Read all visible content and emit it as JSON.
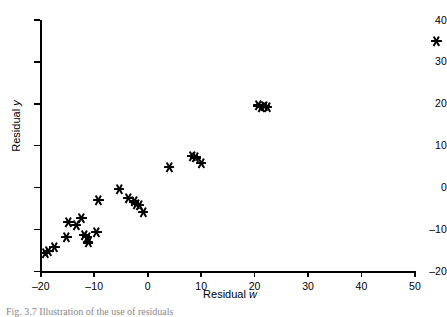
{
  "chart_data": {
    "type": "scatter",
    "title": "",
    "xlabel": "Residual w",
    "ylabel": "Residual y",
    "xlim": [
      -20,
      50
    ],
    "ylim": [
      -20,
      40
    ],
    "xticks": [
      -20,
      -10,
      0,
      10,
      20,
      30,
      40,
      50
    ],
    "yticks": [
      -20,
      -10,
      0,
      10,
      20,
      30,
      40
    ],
    "xticklabels": [
      "-20",
      "-10",
      "0",
      "10",
      "20",
      "30",
      "40",
      "50"
    ],
    "yticklabels": [
      "-20",
      "-10",
      "0",
      "10",
      "20",
      "30",
      "40"
    ],
    "grid": false,
    "legend": null,
    "marker": "asterisk",
    "marker_color": "#000000",
    "series": [
      {
        "name": "residuals",
        "points": [
          [
            -19.2,
            -15.6
          ],
          [
            -18.6,
            -15.2
          ],
          [
            -17.4,
            -14.1
          ],
          [
            -15.2,
            -11.7
          ],
          [
            -14.8,
            -8.3
          ],
          [
            -13.4,
            -9.0
          ],
          [
            -12.4,
            -7.2
          ],
          [
            -11.8,
            -11.4
          ],
          [
            -11.4,
            -11.8
          ],
          [
            -11.2,
            -13.1
          ],
          [
            -9.6,
            -10.5
          ],
          [
            -9.2,
            -2.9
          ],
          [
            -5.4,
            -0.3
          ],
          [
            -3.6,
            -2.4
          ],
          [
            -2.6,
            -3.3
          ],
          [
            -2.2,
            -4.0
          ],
          [
            -1.6,
            -4.2
          ],
          [
            -0.9,
            -5.9
          ],
          [
            4.0,
            4.9
          ],
          [
            8.4,
            7.6
          ],
          [
            8.9,
            7.2
          ],
          [
            10.0,
            5.8
          ],
          [
            20.6,
            19.6
          ],
          [
            21.2,
            19.3
          ],
          [
            21.8,
            19.4
          ],
          [
            22.3,
            19.2
          ],
          [
            54.0,
            35.0
          ]
        ]
      }
    ]
  },
  "caption": {
    "text": "Fig. 3.7  Illustration of the use of residuals"
  }
}
